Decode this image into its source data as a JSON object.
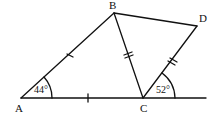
{
  "diagram": {
    "type": "geometry",
    "points": {
      "A": {
        "label": "A",
        "x": 21,
        "y": 98
      },
      "B": {
        "label": "B",
        "x": 114,
        "y": 13
      },
      "C": {
        "label": "C",
        "x": 143,
        "y": 98
      },
      "D": {
        "label": "D",
        "x": 197,
        "y": 26
      }
    },
    "segments": [
      "AB",
      "BC",
      "BD",
      "CD",
      "AC",
      "C-ray-right"
    ],
    "angles": {
      "A": {
        "label": "44°",
        "vertex": "A"
      },
      "C": {
        "label": "52°",
        "vertex": "C",
        "between": "CD and ray right of C"
      }
    },
    "tick_marks": {
      "AB": 1,
      "AC": 1,
      "BC": 2,
      "CD": 2
    },
    "colors": {
      "stroke": "#111111",
      "background": "#ffffff"
    }
  }
}
